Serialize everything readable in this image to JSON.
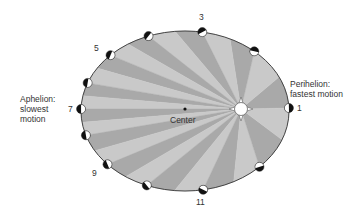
{
  "labels": {
    "aphelion_line1": "Aphelion:",
    "aphelion_line2": "slowest",
    "aphelion_line3": "motion",
    "perihelion_line1": "Perihelion:",
    "perihelion_line2": "fastest motion",
    "center": "Center"
  },
  "position_numbers": {
    "n1": "1",
    "n3": "3",
    "n5": "5",
    "n7": "7",
    "n9": "9",
    "n11": "11"
  },
  "colors": {
    "sector_dark": "#a9a9a9",
    "sector_light": "#c9c9c9",
    "orbit_outline": "#444444",
    "planet_dark": "#111111",
    "planet_light": "#ffffff"
  },
  "orbit": {
    "center": [
      185,
      111
    ],
    "rx": 103,
    "ry": 80,
    "sun": [
      241,
      109
    ],
    "planet_positions": [
      [
        288,
        108
      ],
      [
        257,
        49
      ],
      [
        203,
        29
      ],
      [
        147,
        33
      ],
      [
        109,
        54
      ],
      [
        88,
        83
      ],
      [
        82,
        109
      ],
      [
        87,
        135
      ],
      [
        108,
        164
      ],
      [
        147,
        185
      ],
      [
        203,
        189
      ],
      [
        257,
        165
      ]
    ]
  }
}
